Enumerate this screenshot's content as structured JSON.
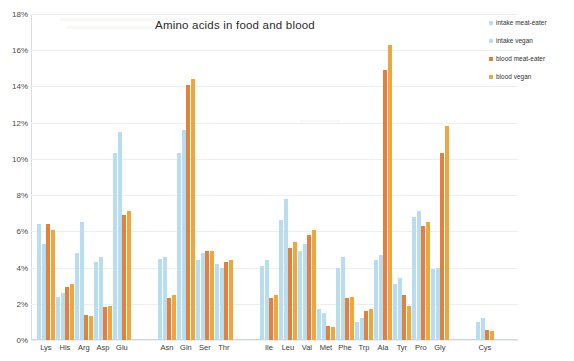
{
  "chart_data": {
    "type": "bar",
    "title": "Amino acids in food and blood",
    "xlabel": "",
    "ylabel": "",
    "ylim": [
      0,
      18
    ],
    "ytick_labels": [
      "0%",
      "2%",
      "4%",
      "6%",
      "8%",
      "10%",
      "12%",
      "14%",
      "16%",
      "18%"
    ],
    "ytick_values": [
      0,
      2,
      4,
      6,
      8,
      10,
      12,
      14,
      16,
      18
    ],
    "grid": false,
    "legend_position": "top-right",
    "value_unit": "%",
    "categories": [
      "Lys",
      "His",
      "Arg",
      "Asp",
      "Glu",
      "Asn",
      "Gln",
      "Ser",
      "Thr",
      "Ile",
      "Leu",
      "Val",
      "Met",
      "Phe",
      "Trp",
      "Ala",
      "Tyr",
      "Pro",
      "Gly",
      "Cys"
    ],
    "series": [
      {
        "name": "intake meat-eater",
        "color": "#b8dcf0",
        "values": [
          6.4,
          2.4,
          4.8,
          4.3,
          10.3,
          4.5,
          10.3,
          4.4,
          4.2,
          4.1,
          6.6,
          4.9,
          1.7,
          4.0,
          1.0,
          4.4,
          3.1,
          6.8,
          3.9,
          1.0
        ]
      },
      {
        "name": "intake vegan",
        "color": "#b8dcf0",
        "values": [
          5.3,
          2.6,
          6.5,
          4.6,
          11.5,
          4.6,
          11.6,
          4.8,
          4.0,
          4.4,
          7.8,
          5.3,
          1.5,
          4.6,
          1.2,
          4.7,
          3.4,
          7.1,
          4.0,
          1.2
        ]
      },
      {
        "name": "blood meat-eater",
        "color": "#e2803c",
        "values": [
          6.4,
          2.9,
          1.4,
          1.8,
          6.9,
          2.3,
          14.1,
          4.9,
          4.3,
          2.3,
          5.1,
          5.8,
          0.8,
          2.3,
          1.6,
          14.9,
          2.5,
          6.3,
          10.3,
          0.55
        ]
      },
      {
        "name": "blood vegan",
        "color": "#eda73f",
        "values": [
          6.1,
          3.1,
          1.3,
          1.9,
          7.1,
          2.5,
          14.4,
          4.9,
          4.4,
          2.5,
          5.4,
          6.1,
          0.7,
          2.4,
          1.7,
          16.3,
          1.9,
          6.5,
          11.8,
          0.5
        ]
      }
    ],
    "group_gaps_after": [
      "Glu",
      "Thr",
      "Gly"
    ]
  },
  "legend": {
    "items": [
      {
        "label": "intake meat-eater",
        "color": "#b8dcf0"
      },
      {
        "label": "intake vegan",
        "color": "#b8dcf0"
      },
      {
        "label": "blood meat-eater",
        "color": "#e2803c"
      },
      {
        "label": "blood vegan",
        "color": "#eda73f"
      }
    ]
  }
}
